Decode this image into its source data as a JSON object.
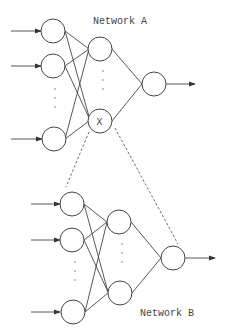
{
  "diagram": {
    "network_a": {
      "label": "Network A",
      "hidden_marked_node_label": "X"
    },
    "network_b": {
      "label": "Network B"
    },
    "colors": {
      "stroke": "#444444",
      "background": "#ffffff"
    }
  }
}
